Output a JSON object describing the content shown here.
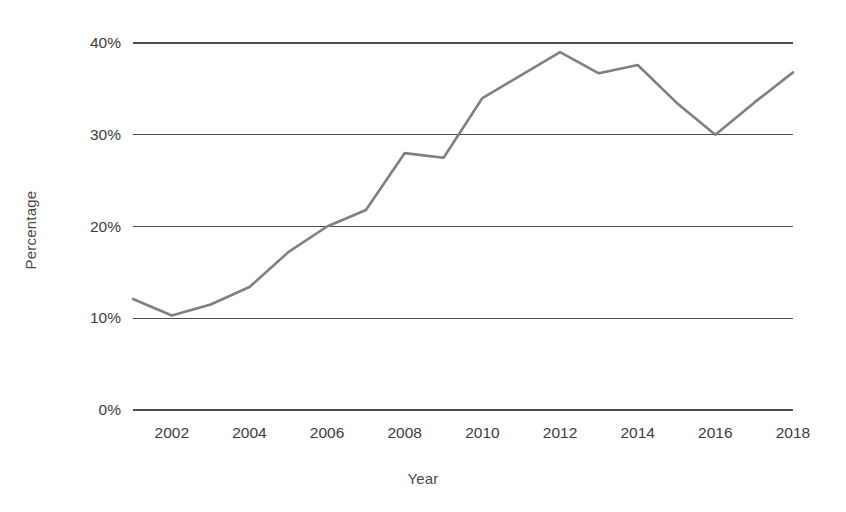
{
  "chart_data": {
    "type": "line",
    "title": "",
    "xlabel": "Year",
    "ylabel": "Percentage",
    "x": [
      2001,
      2002,
      2003,
      2004,
      2005,
      2006,
      2007,
      2008,
      2009,
      2010,
      2011,
      2012,
      2013,
      2014,
      2015,
      2016,
      2017,
      2018
    ],
    "values": [
      12.1,
      10.3,
      11.5,
      13.4,
      17.2,
      20.0,
      21.8,
      28.0,
      27.5,
      34.0,
      36.5,
      39.0,
      36.7,
      37.6,
      33.5,
      30.0,
      33.5,
      36.8
    ],
    "series": [
      {
        "name": "Percentage",
        "values": [
          12.1,
          10.3,
          11.5,
          13.4,
          17.2,
          20.0,
          21.8,
          28.0,
          27.5,
          34.0,
          36.5,
          39.0,
          36.7,
          37.6,
          33.5,
          30.0,
          33.5,
          36.8
        ],
        "color": "#808080"
      }
    ],
    "xlim": [
      2001,
      2018
    ],
    "ylim": [
      0,
      40
    ],
    "xticks": [
      2002,
      2004,
      2006,
      2008,
      2010,
      2012,
      2014,
      2016,
      2018
    ],
    "xtick_labels": [
      "2002",
      "2004",
      "2006",
      "2008",
      "2010",
      "2012",
      "2014",
      "2016",
      "2018"
    ],
    "yticks": [
      0,
      10,
      20,
      30,
      40
    ],
    "ytick_labels": [
      "0%",
      "10%",
      "20%",
      "30%",
      "40%"
    ],
    "grid": true,
    "grid_axis": "y",
    "grid_color": "#4d4d4d",
    "legend": false,
    "legend_position": "none",
    "background_color": "#ffffff",
    "annotations": []
  },
  "geometry": {
    "plot_left": 133,
    "plot_right": 793,
    "y_zero": 410,
    "y_top": 43
  }
}
